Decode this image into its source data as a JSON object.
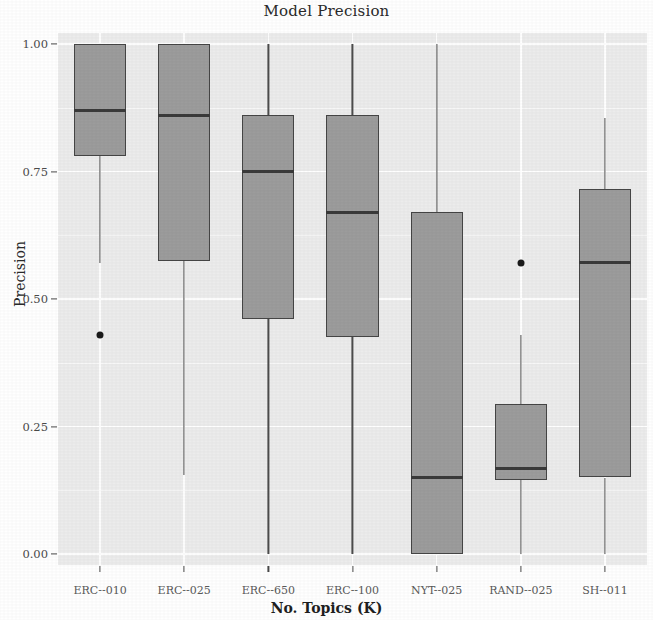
{
  "chart_data": {
    "type": "box",
    "title": "Model Precision",
    "xlabel": "No. Topics (K)",
    "ylabel": "Precision",
    "ylim": [
      0.0,
      1.0
    ],
    "ytick_labels": [
      "0.00",
      "0.25",
      "0.50",
      "0.75",
      "1.00"
    ],
    "ytick_values": [
      0.0,
      0.25,
      0.5,
      0.75,
      1.0
    ],
    "grid": true,
    "legend": "none",
    "categories": [
      "ERC--010",
      "ERC--025",
      "ERC--650",
      "ERC--100",
      "NYT--025",
      "RAND--025",
      "SH--011"
    ],
    "boxes": [
      {
        "category": "ERC--010",
        "whisker_low": 0.57,
        "q1": 0.78,
        "median": 0.87,
        "q3": 1.0,
        "whisker_high": 1.0,
        "outliers": [
          0.43
        ]
      },
      {
        "category": "ERC--025",
        "whisker_low": 0.155,
        "q1": 0.575,
        "median": 0.86,
        "q3": 1.0,
        "whisker_high": 1.0,
        "outliers": []
      },
      {
        "category": "ERC--650",
        "whisker_low": 0.0,
        "q1": 0.46,
        "median": 0.75,
        "q3": 0.86,
        "whisker_high": 1.0,
        "outliers": []
      },
      {
        "category": "ERC--100",
        "whisker_low": 0.0,
        "q1": 0.425,
        "median": 0.67,
        "q3": 0.86,
        "whisker_high": 1.0,
        "outliers": []
      },
      {
        "category": "NYT--025",
        "whisker_low": 0.0,
        "q1": 0.0,
        "median": 0.15,
        "q3": 0.67,
        "whisker_high": 1.0,
        "outliers": []
      },
      {
        "category": "RAND--025",
        "whisker_low": 0.0,
        "q1": 0.145,
        "median": 0.168,
        "q3": 0.295,
        "whisker_high": 0.43,
        "outliers": [
          0.57
        ]
      },
      {
        "category": "SH--011",
        "whisker_low": 0.0,
        "q1": 0.15,
        "median": 0.572,
        "q3": 0.715,
        "whisker_high": 0.855,
        "outliers": []
      }
    ],
    "colors": {
      "panel_background": "#ececec",
      "grid_major": "#ffffff",
      "box_fill": "#9c9c9c",
      "box_border": "#454545",
      "median": "#3a3a3a",
      "whisker": "#4d4d4d",
      "outlier": "#1a1a1a",
      "text": "#2a2a2a"
    }
  }
}
